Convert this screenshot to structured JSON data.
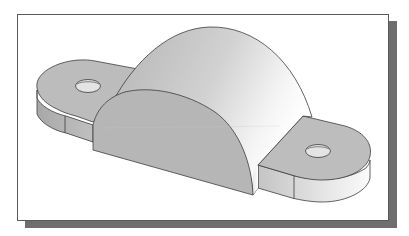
{
  "figure": {
    "components": [
      {
        "name": "left-flange",
        "feature": "rounded-end flange with through hole"
      },
      {
        "name": "half-cylinder-body",
        "feature": "semicircular arch"
      },
      {
        "name": "right-flange",
        "feature": "rounded-end flange with through hole"
      }
    ]
  },
  "colors": {
    "frame_border": "#5a5a5a",
    "shadow": "#6e6e6e",
    "background": "#ffffff",
    "face_medium": "#b8b8b8",
    "face_light": "#d6d6d6",
    "face_highlight": "#f2f2f2",
    "edge": "#3c3c3c"
  }
}
